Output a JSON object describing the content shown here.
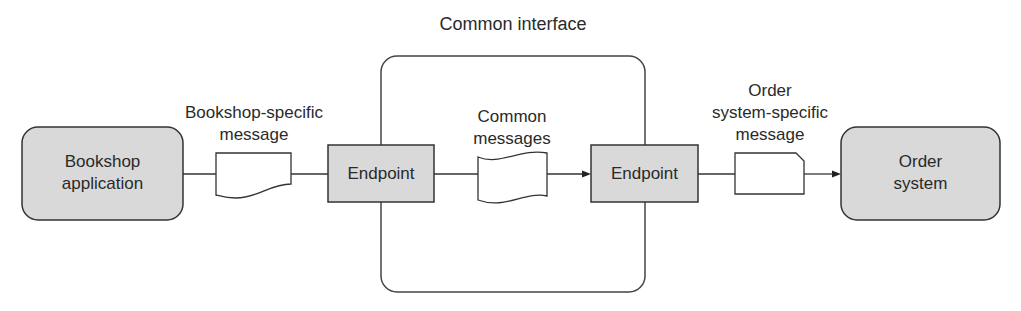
{
  "diagram": {
    "title": "Common interface",
    "nodes": {
      "bookshop": {
        "line1": "Bookshop",
        "line2": "application"
      },
      "endpoint_left": {
        "label": "Endpoint"
      },
      "endpoint_right": {
        "label": "Endpoint"
      },
      "order_system": {
        "line1": "Order",
        "line2": "system"
      }
    },
    "messages": {
      "bookshop_msg": {
        "line1": "Bookshop-specific",
        "line2": "message"
      },
      "common_msg": {
        "line1": "Common",
        "line2": "messages"
      },
      "order_msg": {
        "line1": "Order",
        "line2": "system-specific",
        "line3": "message"
      }
    },
    "colors": {
      "node_fill": "#d9d9d9",
      "stroke": "#333333",
      "background": "#ffffff"
    }
  }
}
